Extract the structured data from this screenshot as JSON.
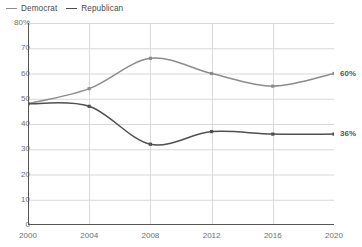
{
  "legend": {
    "position": "top-left",
    "entries": [
      {
        "name": "democrat",
        "label": "Democrat",
        "color": "#8c8c8c"
      },
      {
        "name": "republican",
        "label": "Republican",
        "color": "#4f4f4f"
      }
    ]
  },
  "axes": {
    "y_ticks": [
      "80%",
      "70",
      "60",
      "50",
      "40",
      "30",
      "20",
      "10",
      "0"
    ],
    "y_values": [
      80,
      70,
      60,
      50,
      40,
      30,
      20,
      10,
      0
    ],
    "x_ticks": [
      "2000",
      "2004",
      "2008",
      "2012",
      "2016",
      "2020"
    ],
    "x_values": [
      2000,
      2004,
      2008,
      2012,
      2016,
      2020
    ]
  },
  "end_labels": [
    {
      "name": "democrat",
      "text": "60%",
      "value": 60
    },
    {
      "name": "republican",
      "text": "36%",
      "value": 36
    }
  ],
  "chart_data": {
    "type": "line",
    "title": "",
    "subtitle": "",
    "xlabel": "",
    "ylabel": "",
    "categories": [
      "2000",
      "2004",
      "2008",
      "2012",
      "2016",
      "2020"
    ],
    "x": [
      2000,
      2004,
      2008,
      2012,
      2016,
      2020
    ],
    "series": [
      {
        "name": "Democrat",
        "color": "#8c8c8c",
        "values": [
          48,
          54,
          66,
          60,
          55,
          60
        ],
        "end_label": "60%"
      },
      {
        "name": "Republican",
        "color": "#4f4f4f",
        "values": [
          48,
          47,
          32,
          37,
          36,
          36
        ],
        "end_label": "36%"
      }
    ],
    "xlim": [
      2000,
      2020
    ],
    "ylim": [
      0,
      80
    ],
    "ygrid": true,
    "xgrid": true,
    "markers": "square",
    "interpolation": "smooth",
    "legend_position": "top-left"
  },
  "style": {
    "background": "#ffffff",
    "grid_color": "#d8d8d8",
    "axis_color": "#555555",
    "tick_text_color": "#6e6e6e"
  }
}
